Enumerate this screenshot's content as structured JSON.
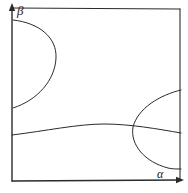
{
  "figure": {
    "kind": "hand-drawn-phase-diagram",
    "background_color": "#ffffff",
    "ink_color": "#2b2b2b",
    "line_width": 1.0,
    "width": 188,
    "height": 193
  },
  "axes": {
    "horizontal": {
      "name": "alpha-axis",
      "label": "α",
      "arrow": "right",
      "from": [
        12,
        181
      ],
      "to": [
        180,
        180
      ]
    },
    "vertical": {
      "name": "beta-axis",
      "label": "β",
      "arrow": "up",
      "from": [
        12,
        181
      ],
      "to": [
        12,
        7
      ]
    },
    "frame": {
      "top_border": [
        [
          12,
          8
        ],
        [
          180,
          9
        ]
      ],
      "right_border": [
        [
          180,
          9
        ],
        [
          180,
          180
        ]
      ]
    }
  },
  "curves": [
    {
      "name": "left-lobe-curve",
      "description": "closed lobe attached to the beta axis, bulging right",
      "path": "M 13 20 C 40 23, 57 38, 56 58 C 55 80, 38 100, 13 108",
      "start_point": [
        13,
        20
      ],
      "apex_point": [
        57,
        58
      ],
      "end_point": [
        13,
        108
      ]
    },
    {
      "name": "right-lobe-curve",
      "description": "lobe attached to the right frame edge, bulging left",
      "path": "M 181 90 C 160 95, 138 108, 133 127 C 130 145, 145 162, 168 168 C 172 169, 177 169, 181 169",
      "start_point": [
        181,
        90
      ],
      "apex_point": [
        132,
        127
      ],
      "end_point": [
        181,
        169
      ]
    },
    {
      "name": "horizontal-transition-curve",
      "description": "near-horizontal curve crossing the plot from the beta axis to the right edge",
      "path": "M 12 135 C 45 131, 78 124, 104 124 C 130 124, 158 129, 181 133",
      "start_point": [
        12,
        135
      ],
      "crest_point": [
        104,
        124
      ],
      "end_point": [
        181,
        133
      ]
    }
  ],
  "intersections": [
    {
      "name": "curve-crossing-point",
      "at": [
        135,
        128
      ],
      "between": [
        "right-lobe-curve",
        "horizontal-transition-curve"
      ]
    }
  ]
}
